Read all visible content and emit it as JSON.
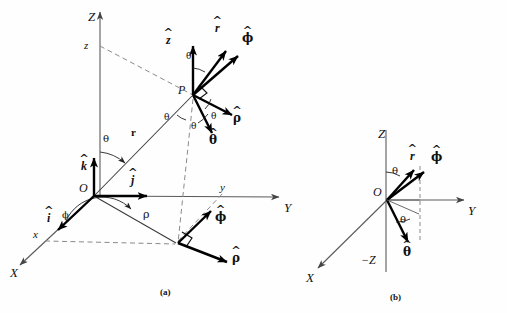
{
  "figure": {
    "captions": [
      {
        "id": "caption-a",
        "text": "(a)",
        "x": 163,
        "y": 291
      },
      {
        "id": "caption-b",
        "text": "(b)",
        "x": 393,
        "y": 296
      }
    ],
    "colors": {
      "ink": "#111111",
      "axis": "#555555",
      "dashed": "#777777",
      "vector": "#000000",
      "background": "#ffffff"
    }
  },
  "panel_a": {
    "name": "(a)",
    "origin_label": "O",
    "axes": [
      {
        "name": "axis-Z",
        "label": "Z",
        "x": 100,
        "y": 18
      },
      {
        "name": "axis-Y",
        "label": "Y",
        "x": 284,
        "y": 212
      },
      {
        "name": "axis-X",
        "label": "X",
        "x": 12,
        "y": 278
      }
    ],
    "coordinate_labels": [
      {
        "name": "coord-z",
        "label": "z",
        "x": 84,
        "y": 49
      },
      {
        "name": "coord-y",
        "label": "y",
        "x": 219,
        "y": 188
      },
      {
        "name": "coord-x",
        "label": "x",
        "x": 33,
        "y": 235
      }
    ],
    "point_label": {
      "name": "point-P",
      "label": "P",
      "x": 170,
      "y": 90
    },
    "origin": {
      "label": "O",
      "x": 79,
      "y": 188
    },
    "radius_label": {
      "name": "radius-r",
      "label": "r",
      "x": 131,
      "y": 133
    },
    "rho_label": {
      "name": "rho-length",
      "label": "ρ",
      "x": 143,
      "y": 215
    },
    "angle_labels": [
      {
        "name": "angle-theta-origin",
        "label": "θ",
        "x": 103,
        "y": 140
      },
      {
        "name": "angle-phi-origin",
        "label": "ϕ",
        "x": 62,
        "y": 216
      },
      {
        "name": "angle-theta-zhat",
        "label": "θ",
        "x": 188,
        "y": 58
      },
      {
        "name": "angle-theta-rhohat",
        "label": "θ",
        "x": 212,
        "y": 118
      },
      {
        "name": "angle-theta-thetahat",
        "label": "θ",
        "x": 192,
        "y": 128
      },
      {
        "name": "angle-theta-lower",
        "label": "θ",
        "x": 166,
        "y": 119
      }
    ],
    "unit_vectors": [
      {
        "name": "unit-vector-z-hat",
        "base": "z",
        "label_x": 168,
        "label_y": 40
      },
      {
        "name": "unit-vector-r-hat",
        "base": "r",
        "label_x": 216,
        "label_y": 28
      },
      {
        "name": "unit-vector-phi-hat-P",
        "base": "ϕ",
        "label_x": 244,
        "label_y": 38
      },
      {
        "name": "unit-vector-rho-hat-P",
        "base": "ρ",
        "label_x": 233,
        "label_y": 118
      },
      {
        "name": "unit-vector-theta-hat-P",
        "base": "θ",
        "label_x": 210,
        "label_y": 140
      },
      {
        "name": "unit-vector-k-hat",
        "base": "k",
        "label_x": 82,
        "label_y": 166
      },
      {
        "name": "unit-vector-j-hat",
        "base": "j",
        "label_x": 132,
        "label_y": 180
      },
      {
        "name": "unit-vector-i-hat",
        "base": "i",
        "label_x": 48,
        "label_y": 218
      },
      {
        "name": "unit-vector-phi-hat-base",
        "base": "ϕ",
        "label_x": 217,
        "label_y": 217
      },
      {
        "name": "unit-vector-rho-hat-base",
        "base": "ρ",
        "label_x": 233,
        "label_y": 258
      }
    ]
  },
  "panel_b": {
    "name": "(b)",
    "axes": [
      {
        "name": "axis-Z",
        "label": "Z",
        "x": 378,
        "y": 134
      },
      {
        "name": "axis-Y",
        "label": "Y",
        "x": 469,
        "y": 212
      },
      {
        "name": "axis-X",
        "label": "X",
        "x": 307,
        "y": 281
      },
      {
        "name": "axis-minus-Z",
        "label": "−Z",
        "x": 362,
        "y": 261
      }
    ],
    "origin": {
      "label": "O",
      "x": 372,
      "y": 190
    },
    "angle_labels": [
      {
        "name": "angle-theta-upper",
        "label": "θ",
        "x": 393,
        "y": 172
      },
      {
        "name": "angle-theta-lower",
        "label": "θ",
        "x": 400,
        "y": 222
      }
    ],
    "unit_vectors": [
      {
        "name": "unit-vector-r-hat",
        "base": "r",
        "label_x": 412,
        "label_y": 157
      },
      {
        "name": "unit-vector-phi-hat",
        "base": "ϕ",
        "label_x": 433,
        "label_y": 158
      },
      {
        "name": "unit-vector-theta-hat",
        "base": "θ",
        "label_x": 405,
        "label_y": 254
      }
    ]
  }
}
